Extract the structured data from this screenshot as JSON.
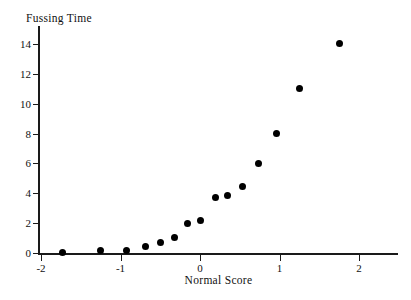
{
  "chart_data": {
    "type": "scatter",
    "title": "",
    "xlabel": "Normal Score",
    "ylabel": "Fussing Time",
    "xlim": [
      -2.2,
      2.2
    ],
    "ylim": [
      -0.6,
      15.0
    ],
    "grid": false,
    "legend": "none",
    "marker": {
      "shape": "circle",
      "filled": true,
      "color": "#000000",
      "size_px": 7
    },
    "xticks": [
      -2,
      -1,
      0,
      1,
      2
    ],
    "xtick_labels": [
      "-2",
      "-1",
      "0",
      "1",
      "2"
    ],
    "yticks": [
      0,
      2,
      4,
      6,
      8,
      10,
      12,
      14
    ],
    "ytick_labels": [
      "0",
      "2",
      "4",
      "6",
      "8",
      "10",
      "12",
      "14"
    ],
    "points": [
      {
        "x": -1.73,
        "y": 0.05
      },
      {
        "x": -1.25,
        "y": 0.15
      },
      {
        "x": -0.93,
        "y": 0.15
      },
      {
        "x": -0.69,
        "y": 0.45
      },
      {
        "x": -0.5,
        "y": 0.7
      },
      {
        "x": -0.32,
        "y": 1.05
      },
      {
        "x": -0.16,
        "y": 1.95
      },
      {
        "x": 0.0,
        "y": 2.15
      },
      {
        "x": 0.19,
        "y": 3.7
      },
      {
        "x": 0.35,
        "y": 3.85
      },
      {
        "x": 0.54,
        "y": 4.45
      },
      {
        "x": 0.74,
        "y": 6.0
      },
      {
        "x": 0.96,
        "y": 8.0
      },
      {
        "x": 1.25,
        "y": 11.0
      },
      {
        "x": 1.75,
        "y": 14.0
      }
    ],
    "n_points": 15
  }
}
